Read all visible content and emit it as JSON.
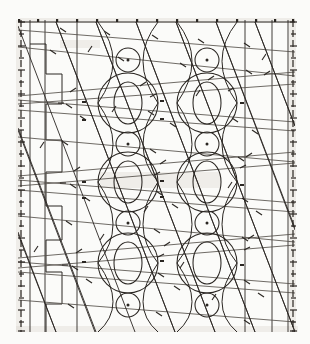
{
  "document": {
    "kind": "scanned technical line diagram",
    "title": "",
    "caption": "",
    "background_color": "#fbfbf9",
    "ink_color": "#2a2622",
    "ink_soft_color": "#55504a",
    "ink_pale_color": "#7a746d"
  },
  "plot": {
    "x": 18,
    "y": 20,
    "width": 277,
    "height": 312,
    "left": 18,
    "right": 295,
    "top": 20,
    "bottom": 332
  },
  "chart_data": {
    "type": "scatter",
    "title": "",
    "subtitle": "",
    "xlabel": "",
    "ylabel": "",
    "xlim": [
      18,
      295
    ],
    "ylim": [
      20,
      332
    ],
    "grid": true,
    "legend": null,
    "annotations": [],
    "axes": {
      "left_axis": {
        "x": 21,
        "from_y": 20,
        "to_y": 332,
        "style": "dashed-with-ticks",
        "tick_count": 26,
        "tick_labels": []
      },
      "right_axis": {
        "x": 293,
        "from_y": 20,
        "to_y": 332,
        "style": "dashed-with-ticks",
        "tick_count": 26,
        "tick_labels": []
      },
      "top_axis": {
        "y": 22,
        "from_x": 18,
        "to_x": 295,
        "style": "solid-with-dots",
        "tick_count": 15,
        "tick_labels": []
      }
    },
    "vertical_gridlines": [
      30,
      45,
      77,
      245,
      272,
      288
    ],
    "horizontal_gridlines": [],
    "lattice": {
      "description": "two-column repeating motif of small dotted circles, large circles and inner ovals",
      "columns_x": [
        128,
        207
      ],
      "small_circle_rows_y": [
        60,
        144,
        223,
        305
      ],
      "small_circle_radius": 12,
      "big_circle_rows_y": [
        103,
        182,
        263
      ],
      "big_circle_radius": 30,
      "inner_oval_rx": 14,
      "inner_oval_ry": 21
    },
    "nodes": [
      {
        "cx": 128,
        "cy": 60,
        "r": 12,
        "center_dot": true
      },
      {
        "cx": 207,
        "cy": 60,
        "r": 12,
        "center_dot": true
      },
      {
        "cx": 128,
        "cy": 144,
        "r": 12,
        "center_dot": true
      },
      {
        "cx": 207,
        "cy": 144,
        "r": 12,
        "center_dot": true
      },
      {
        "cx": 128,
        "cy": 223,
        "r": 12,
        "center_dot": true
      },
      {
        "cx": 207,
        "cy": 223,
        "r": 12,
        "center_dot": true
      },
      {
        "cx": 128,
        "cy": 305,
        "r": 12,
        "center_dot": true
      },
      {
        "cx": 207,
        "cy": 305,
        "r": 12,
        "center_dot": true
      }
    ],
    "big_nodes": [
      {
        "cx": 128,
        "cy": 103,
        "r": 30
      },
      {
        "cx": 207,
        "cy": 103,
        "r": 30
      },
      {
        "cx": 128,
        "cy": 182,
        "r": 30
      },
      {
        "cx": 207,
        "cy": 182,
        "r": 30
      },
      {
        "cx": 128,
        "cy": 263,
        "r": 30
      },
      {
        "cx": 207,
        "cy": 263,
        "r": 30
      }
    ],
    "inner_ovals": [
      {
        "cx": 128,
        "cy": 103,
        "rx": 14,
        "ry": 21
      },
      {
        "cx": 207,
        "cy": 103,
        "rx": 14,
        "ry": 21
      },
      {
        "cx": 128,
        "cy": 182,
        "rx": 14,
        "ry": 21
      },
      {
        "cx": 207,
        "cy": 182,
        "rx": 14,
        "ry": 21
      },
      {
        "cx": 128,
        "cy": 263,
        "rx": 14,
        "ry": 21
      },
      {
        "cx": 207,
        "cy": 263,
        "rx": 14,
        "ry": 21
      }
    ],
    "shallow_rays": [
      {
        "x1": 18,
        "y1": 30,
        "x2": 295,
        "y2": 52
      },
      {
        "x1": 18,
        "y1": 47,
        "x2": 295,
        "y2": 76
      },
      {
        "x1": 18,
        "y1": 96,
        "x2": 295,
        "y2": 72
      },
      {
        "x1": 18,
        "y1": 104,
        "x2": 295,
        "y2": 84
      },
      {
        "x1": 18,
        "y1": 100,
        "x2": 295,
        "y2": 122
      },
      {
        "x1": 18,
        "y1": 110,
        "x2": 295,
        "y2": 131
      },
      {
        "x1": 18,
        "y1": 137,
        "x2": 295,
        "y2": 162
      },
      {
        "x1": 18,
        "y1": 176,
        "x2": 295,
        "y2": 152
      },
      {
        "x1": 18,
        "y1": 186,
        "x2": 295,
        "y2": 163
      },
      {
        "x1": 18,
        "y1": 180,
        "x2": 295,
        "y2": 203
      },
      {
        "x1": 18,
        "y1": 190,
        "x2": 295,
        "y2": 212
      },
      {
        "x1": 18,
        "y1": 216,
        "x2": 295,
        "y2": 242
      },
      {
        "x1": 18,
        "y1": 258,
        "x2": 295,
        "y2": 234
      },
      {
        "x1": 18,
        "y1": 268,
        "x2": 295,
        "y2": 245
      },
      {
        "x1": 18,
        "y1": 262,
        "x2": 295,
        "y2": 284
      },
      {
        "x1": 18,
        "y1": 272,
        "x2": 295,
        "y2": 293
      },
      {
        "x1": 18,
        "y1": 300,
        "x2": 295,
        "y2": 322
      }
    ],
    "steep_rays": [
      {
        "x1": 56,
        "y1": 22,
        "x2": 175,
        "y2": 332
      },
      {
        "x1": 96,
        "y1": 22,
        "x2": 215,
        "y2": 332
      },
      {
        "x1": 136,
        "y1": 22,
        "x2": 255,
        "y2": 332
      },
      {
        "x1": 176,
        "y1": 22,
        "x2": 295,
        "y2": 332
      },
      {
        "x1": 216,
        "y1": 22,
        "x2": 295,
        "y2": 228
      },
      {
        "x1": 255,
        "y1": 22,
        "x2": 295,
        "y2": 126
      },
      {
        "x1": 18,
        "y1": 128,
        "x2": 96,
        "y2": 332
      },
      {
        "x1": 18,
        "y1": 232,
        "x2": 56,
        "y2": 332
      },
      {
        "x1": 135,
        "y1": 332,
        "x2": 18,
        "y2": 26
      },
      {
        "x1": 175,
        "y1": 332,
        "x2": 56,
        "y2": 22
      },
      {
        "x1": 215,
        "y1": 332,
        "x2": 96,
        "y2": 22
      },
      {
        "x1": 255,
        "y1": 332,
        "x2": 136,
        "y2": 22
      },
      {
        "x1": 295,
        "y1": 332,
        "x2": 176,
        "y2": 22
      },
      {
        "x1": 295,
        "y1": 230,
        "x2": 216,
        "y2": 22
      },
      {
        "x1": 295,
        "y1": 126,
        "x2": 255,
        "y2": 22
      },
      {
        "x1": 95,
        "y1": 332,
        "x2": 18,
        "y2": 130
      },
      {
        "x1": 56,
        "y1": 332,
        "x2": 18,
        "y2": 234
      }
    ],
    "step_polyline": {
      "points": "30,44 46,44 46,74 62,74 62,104 46,104 46,140 62,140 62,172 46,172 46,206 62,206 62,240 46,240 46,272 62,272 62,304 46,304 46,332",
      "description": "stepped staircase polyline at left of plot"
    },
    "tick_marks_on_rays": {
      "count": 140,
      "length": 5,
      "description": "short cross ticks drawn along every ray"
    }
  }
}
